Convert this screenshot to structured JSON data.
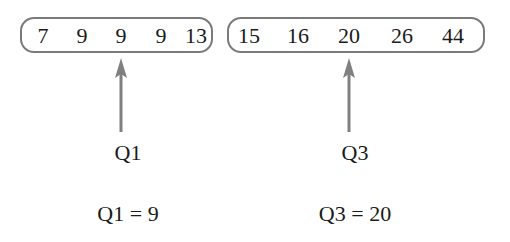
{
  "lower_half": {
    "values": [
      "7",
      "9",
      "9",
      "9",
      "13"
    ],
    "x_positions": [
      43,
      82,
      121,
      161,
      196
    ]
  },
  "upper_half": {
    "values": [
      "15",
      "16",
      "20",
      "26",
      "44"
    ],
    "x_positions": [
      249,
      298,
      349,
      402,
      453
    ]
  },
  "arrows": [
    {
      "label": "Q1",
      "x": 121
    },
    {
      "label": "Q3",
      "x": 349
    }
  ],
  "results": [
    {
      "text": "Q1 = 9",
      "x": 128
    },
    {
      "text": "Q3 = 20",
      "x": 355
    }
  ],
  "colors": {
    "border": "#7a7a7a",
    "arrow": "#808080",
    "text": "#1a1a1a"
  }
}
